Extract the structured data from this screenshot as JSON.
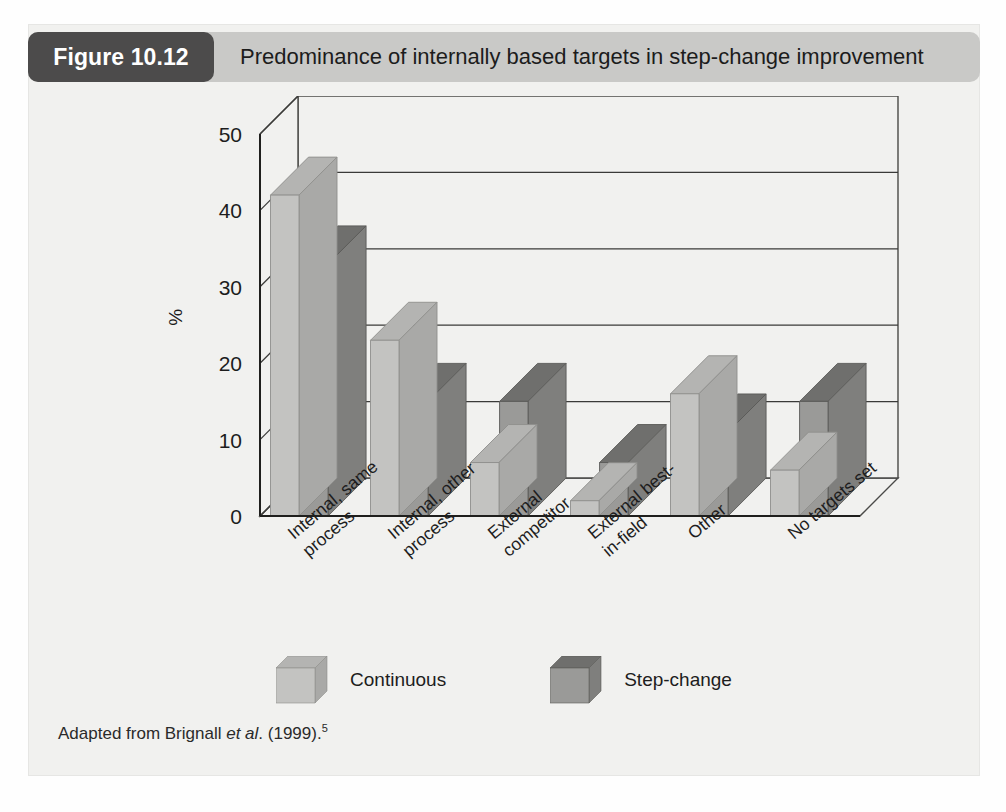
{
  "figure": {
    "tag": "Figure 10.12",
    "title": "Predominance of internally based targets in step-change improvement",
    "tag_background": "#4c4b4b",
    "bar_background": "#c9c9c7",
    "panel_background": "#f1f1ef"
  },
  "source": {
    "prefix": "Adapted from Brignall ",
    "italic": "et al",
    "middle": ". (1999).",
    "superscript": "5"
  },
  "legend": {
    "position": "bottom-center",
    "items": [
      {
        "label": "Continuous",
        "color": "#c3c3c1",
        "top_color": "#b4b4b2",
        "side_color": "#a9a9a7"
      },
      {
        "label": "Step-change",
        "color": "#9a9a98",
        "top_color": "#6f6f6d",
        "side_color": "#7f7f7d"
      }
    ]
  },
  "chart_data": {
    "type": "bar",
    "title": "Predominance of internally based targets in step-change improvement",
    "subtitle": "",
    "xlabel": "",
    "ylabel": "%",
    "ylim": [
      0,
      50
    ],
    "yticks": [
      0,
      10,
      20,
      30,
      40,
      50
    ],
    "ytick_labels": [
      "0",
      "10",
      "20",
      "30",
      "40",
      "50"
    ],
    "grid": true,
    "grid_orientation": "horizontal",
    "three_d": true,
    "categories": [
      "Internal, same process",
      "Internal, other process",
      "External competitor",
      "External best-in-field",
      "Other",
      "No targets set"
    ],
    "category_lines": [
      [
        "Internal, same",
        "process"
      ],
      [
        "Internal, other",
        "process"
      ],
      [
        "External",
        "competitor"
      ],
      [
        "External best-",
        "in-field"
      ],
      [
        "Other"
      ],
      [
        "No targets set"
      ]
    ],
    "series": [
      {
        "name": "Continuous",
        "color": "#c3c3c1",
        "values": [
          42,
          23,
          7,
          2,
          16,
          6
        ]
      },
      {
        "name": "Step-change",
        "color": "#9a9a98",
        "values": [
          33,
          15,
          15,
          7,
          11,
          15
        ]
      }
    ]
  }
}
